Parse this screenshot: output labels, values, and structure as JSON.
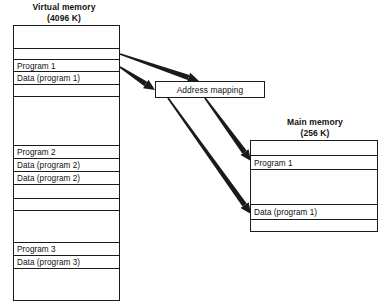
{
  "diagram": {
    "background_color": "#ffffff",
    "line_color": "#1a1a1a"
  },
  "virtual_memory": {
    "caption_line1": "Virtual memory",
    "caption_line2": "(4096 K)",
    "rows": [
      {
        "label": "",
        "height": 23
      },
      {
        "label": "",
        "height": 11
      },
      {
        "label": "Program 1",
        "height": 12
      },
      {
        "label": "Data (program 1)",
        "height": 13
      },
      {
        "label": "",
        "height": 12
      },
      {
        "label": "",
        "height": 49
      },
      {
        "label": "Program 2",
        "height": 13
      },
      {
        "label": "Data (program 2)",
        "height": 13
      },
      {
        "label": "Data (program 2)",
        "height": 13
      },
      {
        "label": "",
        "height": 14
      },
      {
        "label": "",
        "height": 12
      },
      {
        "label": "",
        "height": 32
      },
      {
        "label": "Program 3",
        "height": 13
      },
      {
        "label": "Data (program 3)",
        "height": 13
      },
      {
        "label": "",
        "height": 13
      }
    ]
  },
  "address_mapping": {
    "label": "Address mapping"
  },
  "main_memory": {
    "caption_line1": "Main memory",
    "caption_line2": "(256 K)",
    "rows": [
      {
        "label": "",
        "height": 15
      },
      {
        "label": "Program 1",
        "height": 14
      },
      {
        "label": "",
        "height": 35
      },
      {
        "label": "Data (program 1)",
        "height": 15
      },
      {
        "label": "",
        "height": 10
      }
    ]
  },
  "arrows": [
    {
      "name": "arrow-program1-to-mapping",
      "from_label": "Program 1",
      "to_label": "Address mapping",
      "x1": 120,
      "y1": 54,
      "x2": 199,
      "y2": 81
    },
    {
      "name": "arrow-data-program1-to-mapping",
      "from_label": "Data (program 1)",
      "to_label": "Address mapping",
      "x1": 120,
      "y1": 67,
      "x2": 155,
      "y2": 90
    },
    {
      "name": "arrow-mapping-to-main-program1",
      "from_label": "Address mapping",
      "to_label": "Program 1",
      "x1": 205,
      "y1": 98,
      "x2": 251,
      "y2": 161
    },
    {
      "name": "arrow-mapping-to-main-data",
      "from_label": "Address mapping",
      "to_label": "Data (program 1)",
      "x1": 168,
      "y1": 98,
      "x2": 251,
      "y2": 214
    }
  ]
}
